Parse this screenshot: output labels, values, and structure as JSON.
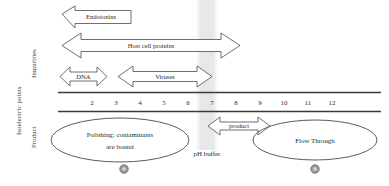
{
  "figure": {
    "type": "process-diagram",
    "axis_labels": {
      "outer": "Isoelectric points",
      "impurities": "Impurities",
      "product": "Product"
    },
    "ph_scale": {
      "ticks": [
        "2",
        "3",
        "4",
        "5",
        "6",
        "7",
        "8",
        "9",
        "10",
        "11",
        "12"
      ],
      "min": 2,
      "max": 12
    },
    "ph_buffer": {
      "label": "pH buffer",
      "band_color": "#e8e8e8",
      "center_ph": 6.7
    },
    "species": [
      {
        "name": "Endotoxins",
        "direction": "left",
        "ph_start": 2.0,
        "ph_end": 3.6
      },
      {
        "name": "Host cell proteins",
        "direction": "both",
        "ph_start": 2.3,
        "ph_end": 9.6
      },
      {
        "name": "DNA",
        "direction": "both",
        "ph_start": 2.0,
        "ph_end": 3.3
      },
      {
        "name": "Viruses",
        "direction": "both",
        "ph_start": 4.0,
        "ph_end": 7.5
      },
      {
        "name": "product",
        "direction": "both",
        "ph_start": 7.1,
        "ph_end": 9.3
      }
    ],
    "modes": [
      {
        "label_line1": "Polishing: contaminants",
        "label_line2": "are bound",
        "side": "left"
      },
      {
        "label_line1": "Flow Through",
        "label_line2": "",
        "side": "right"
      }
    ],
    "markers": [
      {
        "name": "marker-left",
        "x": 124,
        "y": 169
      },
      {
        "name": "marker-right",
        "x": 315,
        "y": 169
      }
    ],
    "colors": {
      "stroke": "#4a4a4a",
      "text": "#2b2b2b",
      "band": "#e9e9e9",
      "marker_fill": "#9a9a9a",
      "rule": "#3a3a3a"
    }
  }
}
